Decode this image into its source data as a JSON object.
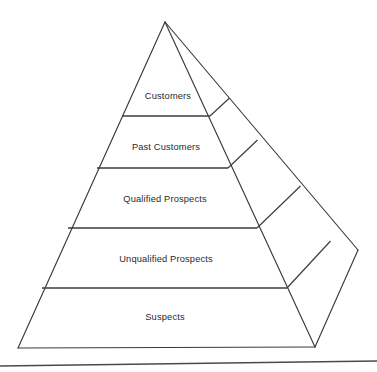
{
  "diagram": {
    "type": "pyramid",
    "orientation": "3d-right-face",
    "background_color": "#ffffff",
    "line_color": "#3b3b3b",
    "text_color": "#2a2a2a",
    "tiers": [
      {
        "id": "customers",
        "label": "Customers",
        "level": 1,
        "label_x": 168,
        "label_y": 97
      },
      {
        "id": "past-customers",
        "label": "Past Customers",
        "level": 2,
        "label_x": 166,
        "label_y": 148
      },
      {
        "id": "qualified-prospects",
        "label": "Qualified Prospects",
        "level": 3,
        "label_x": 165,
        "label_y": 200
      },
      {
        "id": "unqualified-prospects",
        "label": "Unqualified Prospects",
        "level": 4,
        "label_x": 166,
        "label_y": 260
      },
      {
        "id": "suspects",
        "label": "Suspects",
        "level": 5,
        "label_x": 165,
        "label_y": 318
      }
    ],
    "geometry": {
      "apex": {
        "x": 165,
        "y": 22
      },
      "base_left": {
        "x": 18,
        "y": 348
      },
      "base_front_right": {
        "x": 315,
        "y": 347
      },
      "base_back_right": {
        "x": 358,
        "y": 250
      },
      "front_face": "165,22 18,348 315,347",
      "side_face": "165,22 315,347 358,250",
      "front_dividers": [
        "122,116 210,116",
        "97,168 228,168",
        "68,228 257,228",
        "42,288 287,288"
      ],
      "side_dividers": [
        "210,116 229,98",
        "228,168 257,140",
        "257,228 300,186",
        "287,288 330,241"
      ],
      "baseline": "0,366 377,361"
    }
  }
}
